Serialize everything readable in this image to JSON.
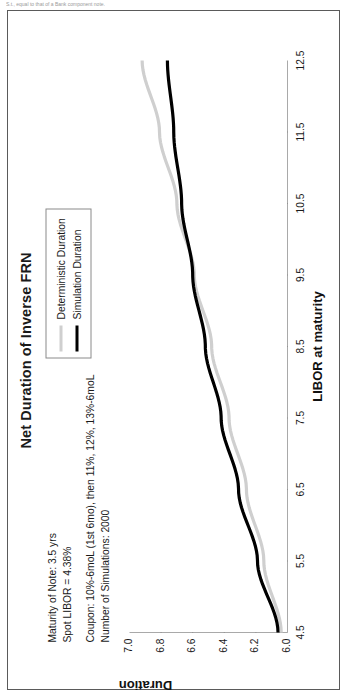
{
  "page": {
    "top_caption": "S.t., equal to that of a Bank component note."
  },
  "figure": {
    "title": "Net Duration of Inverse FRN",
    "annotations": [
      [
        "Maturity of Note: 3.5 yrs",
        "Spot LIBOR = 4.38%"
      ],
      [
        "Coupon: 10%-6moL (1st 6mo), then 11%, 12%, 13%-6moL",
        "Number of Simulations: 2000"
      ]
    ],
    "legend": {
      "position": "upper-right",
      "items": [
        {
          "label": "Deterministic Duration",
          "color": "#cfcfcf",
          "width": 3
        },
        {
          "label": "Simulation Duration",
          "color": "#000000",
          "width": 3
        }
      ]
    }
  },
  "chart_data": {
    "type": "line",
    "title": "Net Duration of Inverse FRN",
    "xlabel": "LIBOR at maturity",
    "ylabel": "Duration",
    "xlim": [
      4.5,
      12.5
    ],
    "ylim": [
      6.0,
      7.0
    ],
    "xticks": [
      4.5,
      5.5,
      6.5,
      7.5,
      8.5,
      9.5,
      10.5,
      11.5,
      12.5
    ],
    "yticks": [
      6.0,
      6.2,
      6.4,
      6.6,
      6.8,
      7.0
    ],
    "xtick_labels": [
      "4.5",
      "5.5",
      "6.5",
      "7.5",
      "8.5",
      "9.5",
      "10.5",
      "11.5",
      "12.5"
    ],
    "ytick_labels": [
      "6.0",
      "6.2",
      "6.4",
      "6.6",
      "6.8",
      "7.0"
    ],
    "grid": false,
    "x": [
      4.5,
      5.5,
      6.5,
      7.5,
      8.5,
      9.5,
      10.5,
      11.5,
      12.5
    ],
    "series": [
      {
        "name": "Deterministic Duration",
        "color": "#cfcfcf",
        "values": [
          6.04,
          6.15,
          6.26,
          6.37,
          6.48,
          6.59,
          6.7,
          6.81,
          6.92
        ]
      },
      {
        "name": "Simulation Duration",
        "color": "#000000",
        "values": [
          6.06,
          6.19,
          6.31,
          6.42,
          6.52,
          6.6,
          6.67,
          6.72,
          6.76
        ]
      }
    ]
  }
}
